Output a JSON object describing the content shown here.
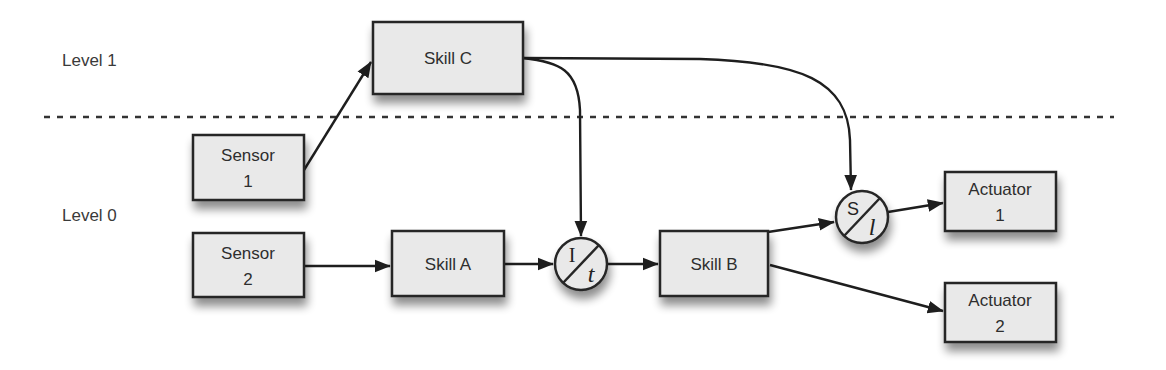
{
  "levels": {
    "level1": "Level 1",
    "level0": "Level 0"
  },
  "nodes": {
    "skill_c": {
      "label": "Skill C"
    },
    "sensor1": {
      "line1": "Sensor",
      "line2": "1"
    },
    "sensor2": {
      "line1": "Sensor",
      "line2": "2"
    },
    "skill_a": {
      "label": "Skill A"
    },
    "skill_b": {
      "label": "Skill B"
    },
    "actuator1": {
      "line1": "Actuator",
      "line2": "1"
    },
    "actuator2": {
      "line1": "Actuator",
      "line2": "2"
    },
    "inhibitor": {
      "top": "I",
      "bottom": "t"
    },
    "suppressor": {
      "top": "S",
      "bottom": "l"
    }
  },
  "edges": [
    {
      "from": "Sensor 1",
      "to": "Skill C"
    },
    {
      "from": "Sensor 2",
      "to": "Skill A"
    },
    {
      "from": "Skill A",
      "to": "Inhibitor I/t"
    },
    {
      "from": "Skill C",
      "to": "Inhibitor I/t"
    },
    {
      "from": "Inhibitor I/t",
      "to": "Skill B"
    },
    {
      "from": "Skill B",
      "to": "Suppressor S/l"
    },
    {
      "from": "Skill C",
      "to": "Suppressor S/l"
    },
    {
      "from": "Suppressor S/l",
      "to": "Actuator 1"
    },
    {
      "from": "Skill B",
      "to": "Actuator 2"
    }
  ],
  "colors": {
    "box_fill": "#e9e9e9",
    "stroke": "#262626",
    "background": "#ffffff"
  }
}
